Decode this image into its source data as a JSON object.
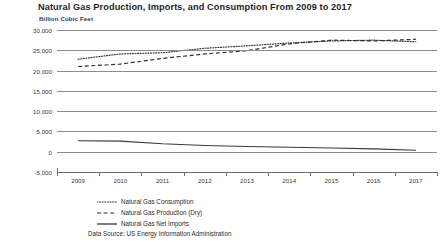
{
  "chart_data": {
    "type": "line",
    "title": "Natural Gas Production, Imports, and Consumption From 2009 to 2017",
    "subtitle": "Billion Cubic Feet",
    "xlabel": "",
    "ylabel": "",
    "unit": "Billion Cubic Feet",
    "categories": [
      "2009",
      "2010",
      "2011",
      "2012",
      "2013",
      "2014",
      "2015",
      "2016",
      "2017"
    ],
    "x": [
      2009,
      2010,
      2011,
      2012,
      2013,
      2014,
      2015,
      2016,
      2017
    ],
    "ylim": [
      -5000,
      30000
    ],
    "ytick_values": [
      -5000,
      0,
      5000,
      10000,
      15000,
      20000,
      25000,
      30000
    ],
    "ytick_labels": [
      "-5,000",
      "0",
      "5,000",
      "10,000",
      "15,000",
      "20,000",
      "25,000",
      "30,000"
    ],
    "grid": true,
    "legend_position": "bottom-left",
    "series": [
      {
        "name": "Natural Gas Consumption",
        "style": "dotted",
        "color": "#3c3c3c",
        "values": [
          22800,
          24100,
          24400,
          25500,
          26100,
          26800,
          27300,
          27500,
          27100
        ]
      },
      {
        "name": "Natural Gas Production (Dry)",
        "style": "dashed",
        "color": "#2e2e2e",
        "values": [
          21000,
          21600,
          23000,
          24100,
          24900,
          26600,
          27500,
          27300,
          27700
        ]
      },
      {
        "name": "Natural Gas Net Imports",
        "style": "solid",
        "color": "#3a3a3a",
        "values": [
          2700,
          2600,
          1950,
          1550,
          1300,
          1100,
          900,
          700,
          350
        ]
      }
    ],
    "annotations": [
      "Data Source: US Energy Information Administration"
    ]
  },
  "legend": {
    "items": [
      {
        "label": "Natural Gas Consumption",
        "style": "dotted"
      },
      {
        "label": "Natural Gas Production (Dry)",
        "style": "dashed"
      },
      {
        "label": "Natural Gas Net Imports",
        "style": "solid"
      }
    ]
  },
  "footer": {
    "source": "Data Source: US Energy Information Administration"
  }
}
